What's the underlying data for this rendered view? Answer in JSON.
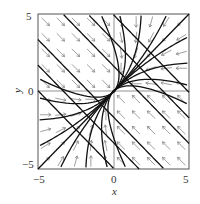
{
  "figure": {
    "type": "phase_portrait"
  },
  "axes": {
    "xlabel": "x",
    "ylabel": "y",
    "xlim": [
      -5,
      5
    ],
    "ylim": [
      -5,
      5
    ],
    "xticks": [
      "-5",
      "0",
      "5"
    ],
    "yticks": [
      "5",
      "0",
      "-5"
    ],
    "grid_lines": [
      "x=0",
      "y=0"
    ]
  },
  "critical_point": {
    "x": 0,
    "y": 0,
    "kind": "stable node"
  },
  "field": {
    "grid_min": -4.5,
    "grid_max": 4.5,
    "grid_step": 1.0,
    "arrow_color": "#777777",
    "trajectory_color": "#111111"
  },
  "trajectories": {
    "upper_left_lines_c": [
      3,
      6,
      9
    ],
    "lower_right_lines_c": [
      3,
      6,
      9
    ],
    "curve_count_each_side": 4
  },
  "colors": {
    "frame": "#555555",
    "text": "#333333"
  }
}
